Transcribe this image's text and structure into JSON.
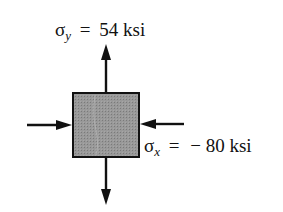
{
  "diagram": {
    "type": "plane-stress-element",
    "element_fill": "#8e8e8e",
    "stroke_color": "#111111",
    "stresses": {
      "sigma_y": {
        "symbol": "σ",
        "subscript": "y",
        "equals": "=",
        "value": "54 ksi",
        "direction": "tension (arrows outward, vertical)"
      },
      "sigma_x": {
        "symbol": "σ",
        "subscript": "x",
        "equals": "=",
        "value": "− 80 ksi",
        "direction": "compression (arrows inward, horizontal)"
      }
    }
  }
}
